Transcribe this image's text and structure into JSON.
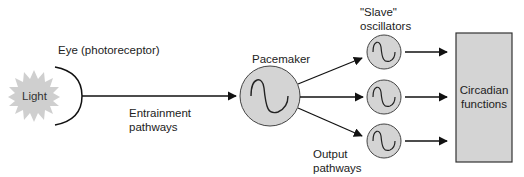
{
  "labels": {
    "eye": "Eye (photoreceptor)",
    "light": "Light",
    "entrainment_line1": "Entrainment",
    "entrainment_line2": "pathways",
    "pacemaker": "Pacemaker",
    "slave_line1": "\"Slave\"",
    "slave_line2": "oscillators",
    "output_line1": "Output",
    "output_line2": "pathways",
    "circadian_line1": "Circadian",
    "circadian_line2": "functions"
  },
  "colors": {
    "fill": "#d4d4d4",
    "stroke": "#333333",
    "line": "#111111"
  },
  "nodes": {
    "light": {
      "cx": 34,
      "cy": 96,
      "r": 24
    },
    "pacemaker": {
      "cx": 270,
      "cy": 96,
      "r": 30
    },
    "slaves": [
      {
        "cx": 384,
        "cy": 52,
        "r": 17
      },
      {
        "cx": 384,
        "cy": 97,
        "r": 17
      },
      {
        "cx": 384,
        "cy": 141,
        "r": 17
      }
    ],
    "functions_box": {
      "x": 456,
      "y": 33,
      "w": 56,
      "h": 129
    }
  }
}
